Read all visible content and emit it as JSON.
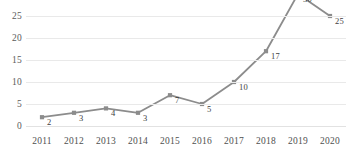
{
  "chart_data": {
    "type": "line",
    "title": "",
    "xlabel": "",
    "ylabel": "",
    "categories": [
      "2011",
      "2012",
      "2013",
      "2014",
      "2015",
      "2016",
      "2017",
      "2018",
      "2019",
      "2020"
    ],
    "values": [
      2,
      3,
      4,
      3,
      7,
      5,
      10,
      17,
      30,
      25
    ],
    "data_labels": [
      "2",
      "3",
      "4",
      "3",
      "7",
      "5",
      "10",
      "17",
      "30",
      "25"
    ],
    "ylim": [
      0,
      30
    ],
    "yticks": [
      0,
      5,
      10,
      15,
      20,
      25,
      30
    ],
    "ytick_labels": [
      "0",
      "5",
      "10",
      "15",
      "20",
      "25",
      "30"
    ],
    "grid": true,
    "grid_axis": "y",
    "legend": false,
    "legend_position": "none",
    "series": [
      {
        "name": "",
        "values": [
          2,
          3,
          4,
          3,
          7,
          5,
          10,
          17,
          30,
          25
        ]
      }
    ],
    "colors": {
      "line": "#8c8c8c",
      "marker": "#8c8c8c",
      "gridline": "#e9e9e9",
      "text": "#4f4f4f",
      "background": "#ffffff"
    },
    "marker_style": "square"
  }
}
